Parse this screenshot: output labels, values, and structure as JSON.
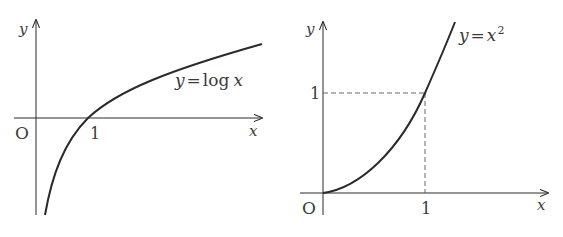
{
  "figures": [
    {
      "id": "log",
      "equation": "y = log x",
      "eq_parts": {
        "lhs": "y",
        "eq": "=",
        "fn": "log",
        "arg": "x"
      },
      "axis_labels": {
        "x": "x",
        "y": "y"
      },
      "origin_label": "O",
      "ticks": {
        "x": [
          "1"
        ]
      }
    },
    {
      "id": "square",
      "equation": "y = x^2",
      "eq_parts": {
        "lhs": "y",
        "eq": "=",
        "base": "x",
        "exp": "2"
      },
      "axis_labels": {
        "x": "x",
        "y": "y"
      },
      "origin_label": "O",
      "ticks": {
        "x": [
          "1"
        ],
        "y": [
          "1"
        ]
      }
    }
  ],
  "colors": {
    "stroke": "#2a2a2a",
    "text": "#3a3a3a",
    "dash": "#555555"
  }
}
